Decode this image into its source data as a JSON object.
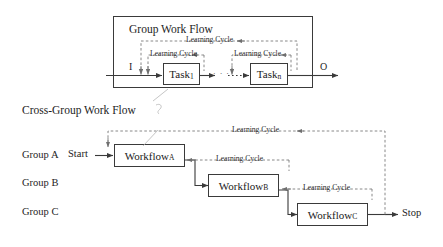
{
  "figure": {
    "type": "flow-diagram",
    "top_panel": {
      "title": "Group Work Flow",
      "input_label": "I",
      "output_label": "O",
      "nodes": [
        {
          "name": "Task",
          "subscript": "1"
        },
        {
          "name": "Task",
          "subscript": "n"
        }
      ],
      "cycles": [
        {
          "label": "Learning Cycle",
          "scope": "outer"
        },
        {
          "label": "Learning Cycle",
          "scope": "task-1"
        },
        {
          "label": "Learning Cycle",
          "scope": "task-n"
        }
      ],
      "ellipsis": "· · ·"
    },
    "bottom_panel": {
      "title": "Cross-Group Work Flow",
      "start_label": "Start",
      "stop_label": "Stop",
      "groups": [
        {
          "label": "Group A"
        },
        {
          "label": "Group B"
        },
        {
          "label": "Group C"
        }
      ],
      "nodes": [
        {
          "name": "Workflow",
          "subscript": "A"
        },
        {
          "name": "Workflow",
          "subscript": "B"
        },
        {
          "name": "Workflow",
          "subscript": "C"
        }
      ],
      "cycles": [
        {
          "label": "Learning Cycle",
          "scope": "outer-a-c"
        },
        {
          "label": "Learning Cycle",
          "scope": "a-b"
        },
        {
          "label": "Learning Cycle",
          "scope": "b-c"
        }
      ]
    },
    "colors": {
      "stroke": "#3a3a3a",
      "dashed_stroke": "#7b7b7b",
      "text": "#1d1d1d",
      "background": "#ffffff"
    }
  }
}
